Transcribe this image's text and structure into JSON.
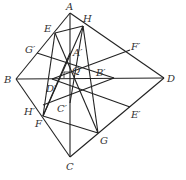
{
  "diagram": {
    "stroke": "#222222",
    "points": {
      "A": {
        "x": 70,
        "y": 13,
        "label": "A",
        "lx": 66,
        "ly": 10
      },
      "B": {
        "x": 16,
        "y": 79,
        "label": "B",
        "lx": 4,
        "ly": 83
      },
      "C": {
        "x": 70,
        "y": 157,
        "label": "C",
        "lx": 66,
        "ly": 170
      },
      "D": {
        "x": 164,
        "y": 78,
        "label": "D",
        "lx": 167,
        "ly": 82
      },
      "E": {
        "x": 55,
        "y": 33,
        "label": "E",
        "lx": 44,
        "ly": 32
      },
      "H": {
        "x": 83,
        "y": 26,
        "label": "H",
        "lx": 83,
        "ly": 22
      },
      "F": {
        "x": 43,
        "y": 116,
        "label": "F",
        "lx": 35,
        "ly": 127
      },
      "G": {
        "x": 98,
        "y": 133,
        "label": "G",
        "lx": 100,
        "ly": 144
      },
      "Gp": {
        "x": 37,
        "y": 53,
        "label": "G′",
        "lx": 25,
        "ly": 53
      },
      "Fp": {
        "x": 130,
        "y": 50,
        "label": "F′",
        "lx": 131,
        "ly": 50
      },
      "Ep": {
        "x": 130,
        "y": 107,
        "label": "E′",
        "lx": 131,
        "ly": 118
      },
      "Hp": {
        "x": 43,
        "y": 105,
        "label": "H′",
        "lx": 24,
        "ly": 115
      },
      "Ap": {
        "x": 70,
        "y": 53,
        "label": "A′",
        "lx": 73,
        "ly": 56
      },
      "Bp": {
        "x": 114,
        "y": 78,
        "label": "B′",
        "lx": 96,
        "ly": 76
      },
      "Cp": {
        "x": 70,
        "y": 103,
        "label": "C′",
        "lx": 57,
        "ly": 112
      },
      "Dp": {
        "x": 52,
        "y": 79,
        "label": "D′",
        "lx": 46,
        "ly": 92
      },
      "Q": {
        "x": 70,
        "y": 78,
        "label": "Q",
        "lx": 72,
        "ly": 74
      }
    },
    "segments": [
      [
        "A",
        "B"
      ],
      [
        "B",
        "C"
      ],
      [
        "C",
        "D"
      ],
      [
        "D",
        "A"
      ],
      [
        "A",
        "C"
      ],
      [
        "B",
        "D"
      ],
      [
        "E",
        "H"
      ],
      [
        "H",
        "G"
      ],
      [
        "G",
        "F"
      ],
      [
        "F",
        "E"
      ],
      [
        "E",
        "G"
      ],
      [
        "H",
        "F"
      ],
      [
        "Gp",
        "Bp"
      ],
      [
        "Fp",
        "Dp"
      ],
      [
        "Ep",
        "Dp"
      ],
      [
        "Hp",
        "Bp"
      ],
      [
        "H",
        "Cp"
      ],
      [
        "F",
        "Ap"
      ]
    ],
    "right_angle_at": "Q"
  }
}
